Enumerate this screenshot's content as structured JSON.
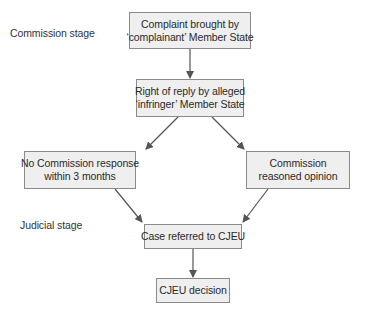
{
  "stages": {
    "commission": "Commission stage",
    "judicial": "Judicial stage"
  },
  "nodes": {
    "complaint": {
      "line1": "Complaint brought by",
      "line2": "‘complainant’ Member State"
    },
    "reply": {
      "line1": "Right of reply by alleged",
      "line2": "‘infringer’ Member State"
    },
    "no_response": {
      "line1": "No Commission response",
      "line2": "within 3 months"
    },
    "reasoned_opinion": {
      "line1": "Commission",
      "line2": "reasoned opinion"
    },
    "referred": {
      "line1": "Case referred to CJEU"
    },
    "decision": {
      "line1": "CJEU decision"
    }
  },
  "edges": [
    {
      "from": "complaint",
      "to": "reply"
    },
    {
      "from": "reply",
      "to": "no_response"
    },
    {
      "from": "reply",
      "to": "reasoned_opinion"
    },
    {
      "from": "no_response",
      "to": "referred"
    },
    {
      "from": "reasoned_opinion",
      "to": "referred"
    },
    {
      "from": "referred",
      "to": "decision"
    }
  ],
  "colors": {
    "box_fill": "#efefef",
    "box_border": "#8a8a8a",
    "arrow": "#555555"
  }
}
